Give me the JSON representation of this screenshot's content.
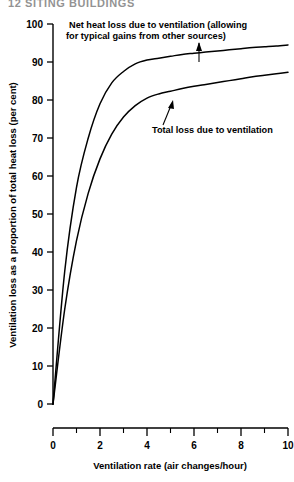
{
  "page": {
    "header": "12  SITING BUILDINGS"
  },
  "chart_data": {
    "type": "line",
    "title": "",
    "xlabel": "Ventilation rate (air changes/hour)",
    "ylabel": "Ventilation loss as a proportion of total heat loss (per cent)",
    "xlim": [
      0,
      10
    ],
    "ylim": [
      0,
      100
    ],
    "xticks": [
      0,
      1,
      2,
      3,
      4,
      5,
      6,
      7,
      8,
      9,
      10
    ],
    "xtick_labels": [
      "0",
      "",
      "2",
      "",
      "4",
      "",
      "6",
      "",
      "8",
      "",
      "10"
    ],
    "yticks": [
      0,
      10,
      20,
      30,
      40,
      50,
      60,
      70,
      80,
      90,
      100
    ],
    "ytick_labels": [
      "0",
      "10",
      "20",
      "30",
      "40",
      "50",
      "60",
      "70",
      "80",
      "90",
      "100"
    ],
    "grid": false,
    "legend_position": "annotations",
    "x": [
      0,
      0.5,
      1,
      1.5,
      2,
      2.5,
      3,
      3.5,
      4,
      4.5,
      5,
      5.5,
      6,
      6.5,
      7,
      7.5,
      8,
      8.5,
      9,
      9.5,
      10
    ],
    "series": [
      {
        "name": "Net heat loss due to ventilation (allowing for typical gains from other sources)",
        "values": [
          0,
          35,
          57,
          70,
          79,
          84.5,
          87.5,
          89.5,
          90.5,
          91,
          91.5,
          92,
          92.3,
          92.6,
          92.9,
          93.2,
          93.5,
          93.8,
          94,
          94.2,
          94.5
        ]
      },
      {
        "name": "Total loss due to ventilation",
        "values": [
          0,
          25,
          43,
          55.5,
          64.5,
          71,
          75.5,
          78.5,
          80.5,
          81.6,
          82.3,
          83,
          83.6,
          84.1,
          84.6,
          85.1,
          85.6,
          86.1,
          86.5,
          86.9,
          87.3
        ]
      }
    ],
    "annotations": [
      {
        "id": "net-heat-loss",
        "line1": "Net heat loss due to ventilation (allowing",
        "line2": "for typical gains from other sources)"
      },
      {
        "id": "total-loss",
        "line1": "Total loss due to ventilation"
      }
    ]
  }
}
